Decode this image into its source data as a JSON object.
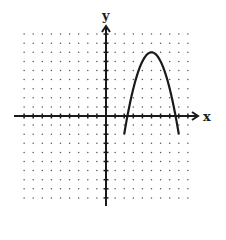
{
  "chart_data": {
    "type": "line",
    "title": "",
    "xlabel": "x",
    "ylabel": "y",
    "xlim": [
      -10,
      10
    ],
    "ylim": [
      -10,
      10
    ],
    "grid": "dotted",
    "grid_step": 1,
    "grid_extent": {
      "x": [
        -9,
        9
      ],
      "y": [
        -9,
        9
      ]
    },
    "tick_marks": "every unit on both axes, unlabeled",
    "series": [
      {
        "name": "parabola",
        "equation": "y = -(x - 5)^2 + 7",
        "vertex": [
          5,
          7
        ],
        "x_intercepts": [
          2.35,
          7.65
        ],
        "domain_shown": [
          2,
          8
        ],
        "endpoints": [
          [
            2,
            -2
          ],
          [
            8,
            -2
          ]
        ],
        "points": [
          [
            2,
            -2
          ],
          [
            3,
            3
          ],
          [
            4,
            6
          ],
          [
            5,
            7
          ],
          [
            6,
            6
          ],
          [
            7,
            3
          ],
          [
            8,
            -2
          ]
        ]
      }
    ]
  },
  "labels": {
    "x_axis": "x",
    "y_axis": "y"
  },
  "colors": {
    "ink": "#1a1a1a",
    "grid_dot": "#555555",
    "background": "#ffffff"
  }
}
